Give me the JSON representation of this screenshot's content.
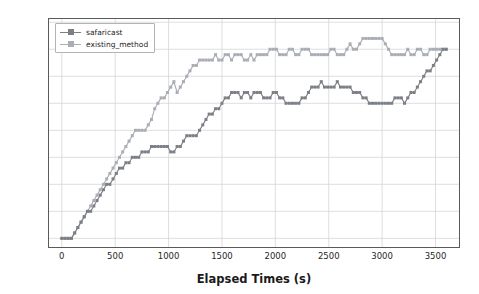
{
  "chart_data": {
    "type": "line",
    "title": "",
    "xlabel": "Elapsed Times (s)",
    "ylabel": "Number of Vehicles in Restricted Zone",
    "xlim": [
      -120,
      3720
    ],
    "ylim": [
      -1.6,
      40.6
    ],
    "xticks": [
      0,
      500,
      1000,
      1500,
      2000,
      2500,
      3000,
      3500
    ],
    "xticklabels": [
      "0",
      "500",
      "1000",
      "1500",
      "2000",
      "2500",
      "3000",
      "3500"
    ],
    "yticks": [
      0,
      5,
      10,
      15,
      20,
      25,
      30,
      35,
      40
    ],
    "yticklabels": [
      "0",
      "5",
      "10",
      "15",
      "20",
      "25",
      "30",
      "35",
      "40"
    ],
    "grid": true,
    "legend_position": "upper left",
    "marker": "square",
    "series": [
      {
        "name": "safaricast",
        "color": "#7b7f86",
        "x": [
          0,
          30,
          60,
          90,
          120,
          150,
          180,
          210,
          240,
          270,
          300,
          330,
          360,
          390,
          420,
          450,
          480,
          510,
          540,
          570,
          600,
          630,
          660,
          690,
          720,
          750,
          780,
          810,
          840,
          870,
          900,
          930,
          960,
          990,
          1020,
          1050,
          1080,
          1110,
          1140,
          1170,
          1200,
          1230,
          1260,
          1290,
          1320,
          1350,
          1380,
          1410,
          1440,
          1470,
          1500,
          1530,
          1560,
          1590,
          1620,
          1650,
          1680,
          1710,
          1740,
          1770,
          1800,
          1830,
          1860,
          1890,
          1920,
          1950,
          1980,
          2010,
          2040,
          2070,
          2100,
          2130,
          2160,
          2190,
          2220,
          2250,
          2280,
          2310,
          2340,
          2370,
          2400,
          2430,
          2460,
          2490,
          2520,
          2550,
          2580,
          2610,
          2640,
          2670,
          2700,
          2730,
          2760,
          2790,
          2820,
          2850,
          2880,
          2910,
          2940,
          2970,
          3000,
          3030,
          3060,
          3090,
          3120,
          3150,
          3180,
          3210,
          3240,
          3270,
          3300,
          3330,
          3360,
          3390,
          3420,
          3450,
          3480,
          3510,
          3540,
          3570,
          3600
        ],
        "y": [
          0,
          0,
          0,
          0,
          1,
          2,
          3,
          4,
          5,
          5,
          6,
          7,
          8,
          9,
          10,
          10,
          11,
          12,
          13,
          13,
          14,
          14,
          15,
          15,
          15,
          16,
          16,
          16,
          17,
          17,
          17,
          17,
          17,
          17,
          16,
          16,
          17,
          17,
          18,
          19,
          19,
          19,
          19,
          20,
          21,
          22,
          23,
          23,
          24,
          24,
          25,
          26,
          26,
          27,
          27,
          27,
          26,
          27,
          27,
          26,
          27,
          27,
          27,
          26,
          26,
          26,
          27,
          27,
          26,
          26,
          25,
          25,
          25,
          25,
          25,
          26,
          26,
          27,
          28,
          28,
          28,
          29,
          28,
          28,
          28,
          28,
          29,
          28,
          28,
          28,
          28,
          27,
          27,
          27,
          26,
          26,
          25,
          25,
          25,
          25,
          25,
          25,
          25,
          25,
          26,
          26,
          26,
          25,
          26,
          27,
          27,
          28,
          29,
          30,
          31,
          31,
          32,
          33,
          34,
          35,
          35
        ]
      },
      {
        "name": "existing_method",
        "color": "#a9adb4",
        "x": [
          0,
          30,
          60,
          90,
          120,
          150,
          180,
          210,
          240,
          270,
          300,
          330,
          360,
          390,
          420,
          450,
          480,
          510,
          540,
          570,
          600,
          630,
          660,
          690,
          720,
          750,
          780,
          810,
          840,
          870,
          900,
          930,
          960,
          990,
          1020,
          1050,
          1080,
          1110,
          1140,
          1170,
          1200,
          1230,
          1260,
          1290,
          1320,
          1350,
          1380,
          1410,
          1440,
          1470,
          1500,
          1530,
          1560,
          1590,
          1620,
          1650,
          1680,
          1710,
          1740,
          1770,
          1800,
          1830,
          1860,
          1890,
          1920,
          1950,
          1980,
          2010,
          2040,
          2070,
          2100,
          2130,
          2160,
          2190,
          2220,
          2250,
          2280,
          2310,
          2340,
          2370,
          2400,
          2430,
          2460,
          2490,
          2520,
          2550,
          2580,
          2610,
          2640,
          2670,
          2700,
          2730,
          2760,
          2790,
          2820,
          2850,
          2880,
          2910,
          2940,
          2970,
          3000,
          3030,
          3060,
          3090,
          3120,
          3150,
          3180,
          3210,
          3240,
          3270,
          3300,
          3330,
          3360,
          3390,
          3420,
          3450,
          3480,
          3510,
          3540,
          3570,
          3600
        ],
        "y": [
          0,
          0,
          0,
          0,
          1,
          2,
          3,
          4,
          5,
          6,
          7,
          8,
          9,
          10,
          11,
          12,
          13,
          14,
          15,
          16,
          17,
          18,
          19,
          20,
          20,
          20,
          20,
          21,
          22,
          24,
          25,
          26,
          26,
          27,
          28,
          29,
          27,
          28,
          29,
          30,
          31,
          32,
          32,
          33,
          33,
          33,
          33,
          33,
          34,
          33,
          33,
          34,
          34,
          33,
          34,
          34,
          34,
          33,
          33,
          34,
          33,
          34,
          34,
          34,
          34,
          35,
          35,
          35,
          34,
          34,
          34,
          35,
          35,
          34,
          34,
          35,
          35,
          35,
          34,
          34,
          34,
          34,
          34,
          34,
          35,
          35,
          34,
          34,
          34,
          35,
          36,
          35,
          35,
          36,
          37,
          37,
          37,
          37,
          37,
          37,
          37,
          36,
          35,
          34,
          34,
          34,
          34,
          34,
          35,
          34,
          34,
          35,
          35,
          34,
          34,
          35,
          35,
          35,
          35,
          35,
          35
        ]
      }
    ]
  },
  "legend": {
    "items": [
      {
        "label": "safaricast"
      },
      {
        "label": "existing_method"
      }
    ]
  },
  "colors": {
    "safaricast": "#7b7f86",
    "existing_method": "#a9adb4",
    "grid": "#d6d6d6",
    "frame": "#5a5a5a",
    "background": "#ffffff",
    "text": "#1f1f1f"
  }
}
